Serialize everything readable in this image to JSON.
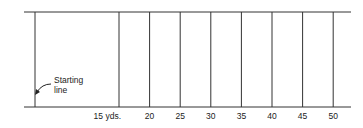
{
  "diagram": {
    "type": "field-distance-markers",
    "starting_label": "Starting\nline",
    "starting_label_lines": [
      "Starting",
      "line"
    ],
    "markers": [
      {
        "yards": 15,
        "label": "15 yds."
      },
      {
        "yards": 20,
        "label": "20"
      },
      {
        "yards": 25,
        "label": "25"
      },
      {
        "yards": 30,
        "label": "30"
      },
      {
        "yards": 35,
        "label": "35"
      },
      {
        "yards": 40,
        "label": "40"
      },
      {
        "yards": 45,
        "label": "45"
      },
      {
        "yards": 50,
        "label": "50"
      }
    ],
    "line_color": "#222222"
  }
}
